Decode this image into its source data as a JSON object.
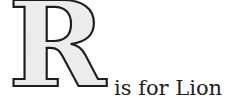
{
  "letter": "R",
  "caption": "is for Lion",
  "colors": {
    "letter_fill": "#ececec",
    "letter_outline": "#1e1e1e",
    "text": "#1e1e1e",
    "background": "#ffffff"
  }
}
